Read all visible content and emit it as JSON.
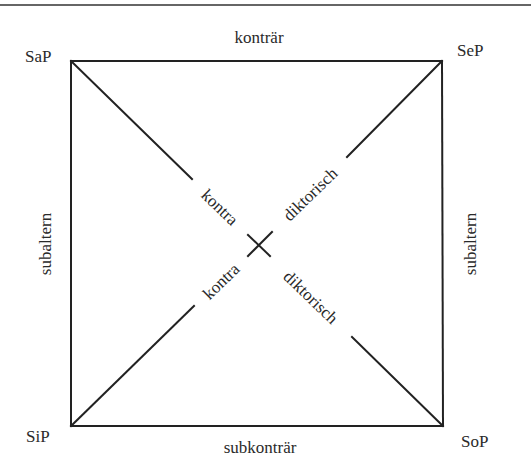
{
  "diagram": {
    "colors": {
      "line": "#222222",
      "text": "#2a2a2a",
      "background": "#ffffff"
    },
    "corners": {
      "top_left": "SaP",
      "top_right": "SeP",
      "bottom_left": "SiP",
      "bottom_right": "SoP"
    },
    "relations": {
      "top": "konträr",
      "bottom": "subkonträr",
      "left": "subaltern",
      "right": "subaltern",
      "diagonal_parts": [
        "kontra",
        "diktorisch"
      ]
    },
    "diagonals": [
      {
        "from": "SaP",
        "to": "SoP",
        "label_a": "kontra",
        "label_b": "diktorisch"
      },
      {
        "from": "SiP",
        "to": "SeP",
        "label_a": "kontra",
        "label_b": "diktorisch"
      }
    ]
  }
}
